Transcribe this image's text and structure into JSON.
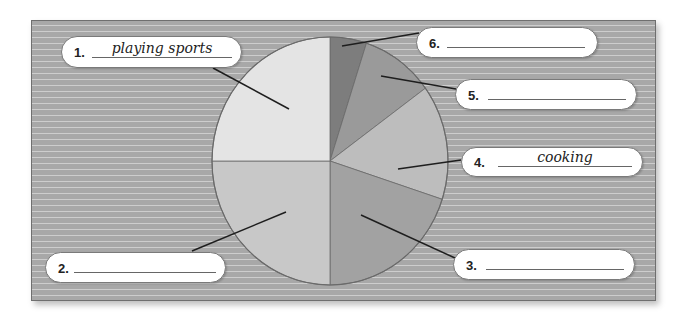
{
  "chart_data": {
    "type": "pie",
    "title": "",
    "start_angle_deg": 0,
    "direction": "clockwise",
    "slices": [
      {
        "label": "6",
        "answer": "",
        "percent": 5,
        "color": "#7d7d7d"
      },
      {
        "label": "5",
        "answer": "",
        "percent": 10,
        "color": "#9a9a9a"
      },
      {
        "label": "4",
        "answer": "cooking",
        "percent": 15,
        "color": "#bdbdbd"
      },
      {
        "label": "3",
        "answer": "",
        "percent": 20,
        "color": "#a2a2a2"
      },
      {
        "label": "2",
        "answer": "",
        "percent": 25,
        "color": "#c8c8c8"
      },
      {
        "label": "1",
        "answer": "playing sports",
        "percent": 25,
        "color": "#e4e4e4"
      }
    ]
  },
  "labels": [
    {
      "num": "1.",
      "answer": "playing sports"
    },
    {
      "num": "2.",
      "answer": ""
    },
    {
      "num": "3.",
      "answer": ""
    },
    {
      "num": "4.",
      "answer": "cooking"
    },
    {
      "num": "5.",
      "answer": ""
    },
    {
      "num": "6.",
      "answer": ""
    }
  ],
  "colors": {
    "panel_bg": "#a8a8a8",
    "pie_outline": "#6a6a6a",
    "leader_line": "#1e1e1e"
  }
}
